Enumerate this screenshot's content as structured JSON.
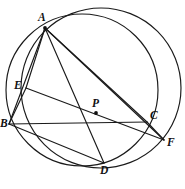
{
  "figure": {
    "width": 185,
    "height": 189,
    "background_color": "#ffffff",
    "stroke_color": "#1a1a1a",
    "label_color": "#111111"
  },
  "points": [
    {
      "id": "A",
      "label": "A",
      "x": 45,
      "y": 28,
      "label_x": 38,
      "label_y": 12,
      "dot": true
    },
    {
      "id": "E",
      "label": "E",
      "x": 26,
      "y": 88,
      "label_x": 14,
      "label_y": 80,
      "dot": false
    },
    {
      "id": "B",
      "label": "B",
      "x": 9,
      "y": 124,
      "label_x": 0,
      "label_y": 118,
      "dot": false
    },
    {
      "id": "P",
      "label": "P",
      "x": 96,
      "y": 113,
      "label_x": 92,
      "label_y": 98,
      "dot": true
    },
    {
      "id": "C",
      "label": "C",
      "x": 147,
      "y": 122,
      "label_x": 150,
      "label_y": 110,
      "dot": false
    },
    {
      "id": "F",
      "label": "F",
      "x": 164,
      "y": 140,
      "label_x": 167,
      "label_y": 137,
      "dot": false
    },
    {
      "id": "D",
      "label": "D",
      "x": 104,
      "y": 163,
      "label_x": 100,
      "label_y": 165,
      "dot": false
    }
  ],
  "circles": [
    {
      "id": "circumcircle-abdc",
      "name": "circle-through-A-B-D-C",
      "cx": 82,
      "cy": 90,
      "r": 76
    },
    {
      "id": "circle-adf",
      "name": "circle-through-A-D-F",
      "cx": 101,
      "cy": 88,
      "r": 80
    }
  ],
  "segments": [
    {
      "id": "AB",
      "from": "A",
      "to": "B",
      "name": "segment-a-b"
    },
    {
      "id": "AE",
      "from": "A",
      "to": "E",
      "name": "segment-a-e"
    },
    {
      "id": "AD",
      "from": "A",
      "to": "D",
      "name": "segment-a-d"
    },
    {
      "id": "AC",
      "from": "A",
      "to": "C",
      "name": "segment-a-c"
    },
    {
      "id": "AF",
      "from": "A",
      "to": "F",
      "name": "segment-a-f"
    },
    {
      "id": "BC",
      "from": "B",
      "to": "C",
      "name": "segment-b-c"
    },
    {
      "id": "EF",
      "from": "E",
      "to": "F",
      "name": "segment-e-f-through-p"
    },
    {
      "id": "EB",
      "from": "E",
      "to": "B",
      "name": "segment-e-b"
    },
    {
      "id": "CF",
      "from": "C",
      "to": "F",
      "name": "segment-c-f"
    },
    {
      "id": "BD",
      "from": "B",
      "to": "D",
      "name": "segment-b-d"
    }
  ],
  "caption": {
    "text": "",
    "visible": false
  }
}
